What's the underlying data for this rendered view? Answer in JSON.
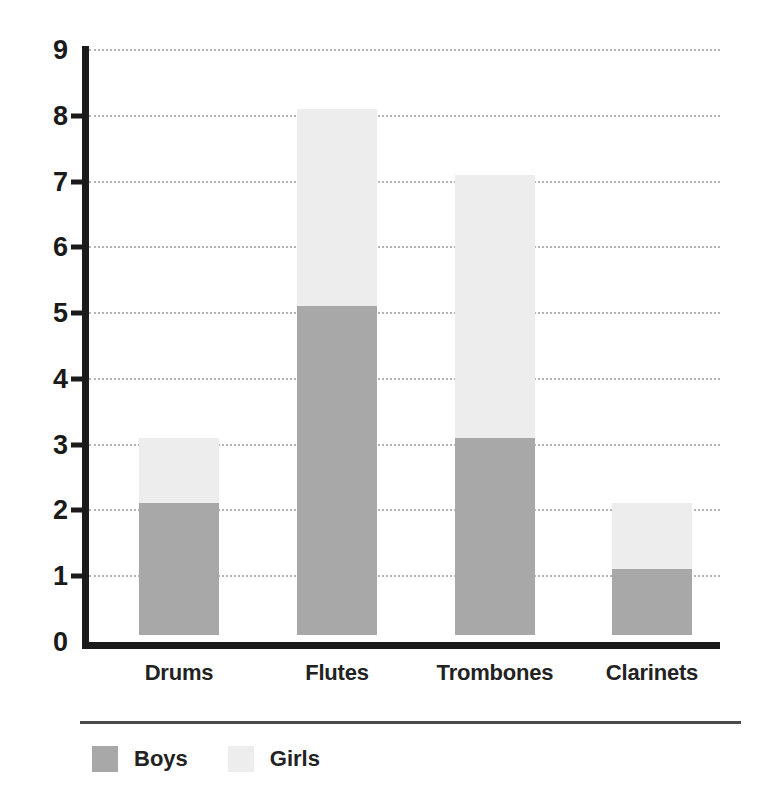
{
  "chart_data": {
    "type": "bar",
    "subtype": "stacked-vertical",
    "title": "",
    "xlabel": "",
    "ylabel": "",
    "categories": [
      "Drums",
      "Flutes",
      "Trombones",
      "Clarinets"
    ],
    "series": [
      {
        "name": "Boys",
        "color": "#a8a8a8",
        "values": [
          2,
          5,
          3,
          1
        ]
      },
      {
        "name": "Girls",
        "color": "#ededed",
        "values": [
          1,
          3,
          4,
          1
        ]
      }
    ],
    "totals": [
      3,
      8,
      7,
      2
    ],
    "ylim": [
      0,
      9
    ],
    "ytick_labels": [
      "0",
      "1",
      "2",
      "3",
      "4",
      "5",
      "6",
      "7",
      "8",
      "9"
    ],
    "ytick_values": [
      0,
      1,
      2,
      3,
      4,
      5,
      6,
      7,
      8,
      9
    ],
    "ytick_interval": 1,
    "grid": {
      "horizontal": true,
      "vertical": false,
      "style": "dotted",
      "color": "#b4b4b4",
      "drawn_at": [
        1,
        2,
        3,
        4,
        5,
        6,
        7,
        8,
        9
      ]
    },
    "legend": {
      "position": "bottom-left",
      "entries": [
        {
          "label": "Boys",
          "color": "#a8a8a8"
        },
        {
          "label": "Girls",
          "color": "#ededed"
        }
      ]
    },
    "axis_color": "#1a1a1a",
    "background_color": "#ffffff"
  }
}
